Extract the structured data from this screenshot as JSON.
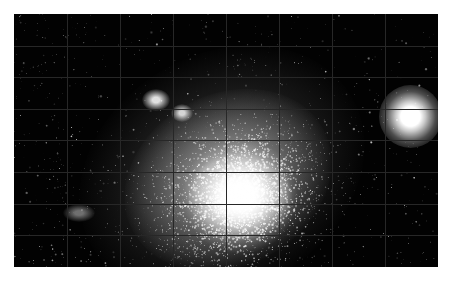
{
  "image": {
    "kind": "astronomical-photograph",
    "subject": "dense star cluster",
    "background_color": "#ffffff",
    "plate_background_color": "#020202",
    "plate": {
      "x": 14,
      "y": 14,
      "width": 424,
      "height": 253
    },
    "grid": {
      "visible": true,
      "color": "#272727",
      "line_width": 1,
      "vertical_spacing": 53,
      "horizontal_spacing": 31.6,
      "vertical_count": 8,
      "horizontal_count": 8
    },
    "features": [
      {
        "name": "cluster-core",
        "description": "saturated white unresolved cluster core",
        "cx": 240,
        "cy": 196,
        "rx": 52,
        "ry": 44,
        "color": "#ffffff",
        "peak_opacity": 1.0
      },
      {
        "name": "cluster-halo",
        "description": "extended resolved halo elongated to upper left",
        "cx": 228,
        "cy": 180,
        "rx": 108,
        "ry": 86,
        "color": "#d8d8d8",
        "peak_opacity": 0.55,
        "rotation": -28
      },
      {
        "name": "cluster-outer-halo",
        "description": "faint outer envelope of resolved stars",
        "cx": 222,
        "cy": 172,
        "rx": 150,
        "ry": 118,
        "color": "#9a9a9a",
        "peak_opacity": 0.3,
        "rotation": -30
      },
      {
        "name": "bright-field-star",
        "description": "bright saturated foreground star at right",
        "cx": 410,
        "cy": 116,
        "r": 15,
        "color": "#ffffff",
        "peak_opacity": 1.0
      },
      {
        "name": "bright-knot-upper-left",
        "description": "bright stellar knot above cluster",
        "cx": 156,
        "cy": 100,
        "rx": 14,
        "ry": 11,
        "color": "#f2f2f2",
        "peak_opacity": 0.92
      },
      {
        "name": "bright-knot-upper-right",
        "description": "second bright knot right of first",
        "cx": 182,
        "cy": 113,
        "rx": 11,
        "ry": 9,
        "color": "#ededed",
        "peak_opacity": 0.88
      },
      {
        "name": "star-group-left",
        "description": "small resolved star group at left",
        "cx": 79,
        "cy": 213,
        "rx": 16,
        "ry": 9,
        "color": "#c8c8c8",
        "peak_opacity": 0.55
      }
    ],
    "starfield": {
      "description": "dense resolved point sources across entire plate",
      "total_stars": 4200,
      "field_star_count": 1500,
      "cluster_star_count": 2700,
      "min_radius": 0.4,
      "max_radius": 1.9,
      "color": "#ffffff"
    }
  }
}
